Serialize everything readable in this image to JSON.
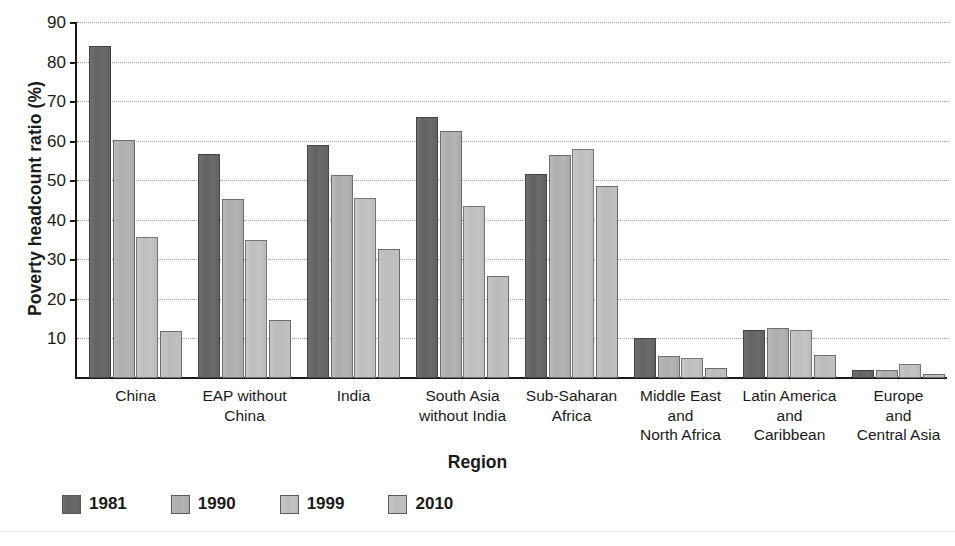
{
  "chart_data": {
    "type": "bar",
    "title": "",
    "xlabel": "Region",
    "ylabel": "Poverty headcount ratio (%)",
    "ylim": [
      0,
      90
    ],
    "yticks": [
      10,
      20,
      30,
      40,
      50,
      60,
      70,
      80,
      90
    ],
    "grid": true,
    "legend_position": "bottom-left",
    "categories": [
      "China",
      "EAP without China",
      "India",
      "South Asia without India",
      "Sub-Saharan Africa",
      "Middle East and North Africa",
      "Latin America and Caribbean",
      "Europe and Central Asia"
    ],
    "category_label_lines": [
      [
        "China"
      ],
      [
        "EAP without",
        "China"
      ],
      [
        "India"
      ],
      [
        "South Asia",
        "without India"
      ],
      [
        "Sub-Saharan",
        "Africa"
      ],
      [
        "Middle East",
        "and",
        "North Africa"
      ],
      [
        "Latin America",
        "and",
        "Caribbean"
      ],
      [
        "Europe",
        "and",
        "Central Asia"
      ]
    ],
    "series": [
      {
        "name": "1981",
        "color": "#656565",
        "values": [
          84.0,
          56.7,
          58.8,
          66.0,
          51.5,
          10.0,
          12.2,
          2.0
        ]
      },
      {
        "name": "1990",
        "color": "#b0b0b0",
        "values": [
          60.2,
          45.2,
          51.3,
          62.5,
          56.5,
          5.5,
          12.7,
          2.0
        ]
      },
      {
        "name": "1999",
        "color": "#c2c2c2",
        "values": [
          35.6,
          35.0,
          45.5,
          43.5,
          58.0,
          5.0,
          12.2,
          3.5
        ]
      },
      {
        "name": "2010",
        "color": "#bfbfbf",
        "values": [
          11.8,
          14.7,
          32.5,
          25.8,
          48.5,
          2.5,
          5.7,
          1.0
        ]
      }
    ]
  },
  "legend": {
    "items": [
      {
        "label": "1981",
        "swatch": "#656565"
      },
      {
        "label": "1990",
        "swatch": "#b0b0b0"
      },
      {
        "label": "1999",
        "swatch": "#c2c2c2"
      },
      {
        "label": "2010",
        "swatch": "#bfbfbf"
      }
    ]
  }
}
